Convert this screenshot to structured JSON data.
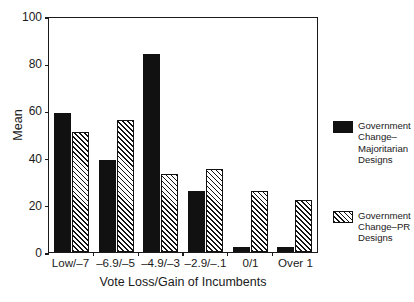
{
  "chart_data": {
    "type": "bar",
    "title": "",
    "xlabel": "Vote Loss/Gain of Incumbents",
    "ylabel": "Mean",
    "ylim": [
      0,
      100
    ],
    "yticks": [
      100,
      80,
      60,
      40,
      20,
      0
    ],
    "grid": false,
    "legend_position": "right",
    "categories": [
      "Low/–7",
      "–6.9/–5",
      "–4.9/–3",
      "–2.9/–.1",
      "0/1",
      "Over 1"
    ],
    "series": [
      {
        "name": "Government Change–Majoritarian Designs",
        "style": "solid-black",
        "values": [
          59,
          39,
          84,
          26,
          2,
          2
        ]
      },
      {
        "name": "Government Change–PR Designs",
        "style": "hatched",
        "values": [
          51,
          56,
          33,
          35,
          26,
          22
        ]
      }
    ]
  },
  "legend": {
    "entries": [
      {
        "label": "Government Change–Majoritarian Designs",
        "swatch": "solid-black-swatch"
      },
      {
        "label": "Government Change–PR Designs",
        "swatch": "hatched-swatch"
      }
    ]
  }
}
